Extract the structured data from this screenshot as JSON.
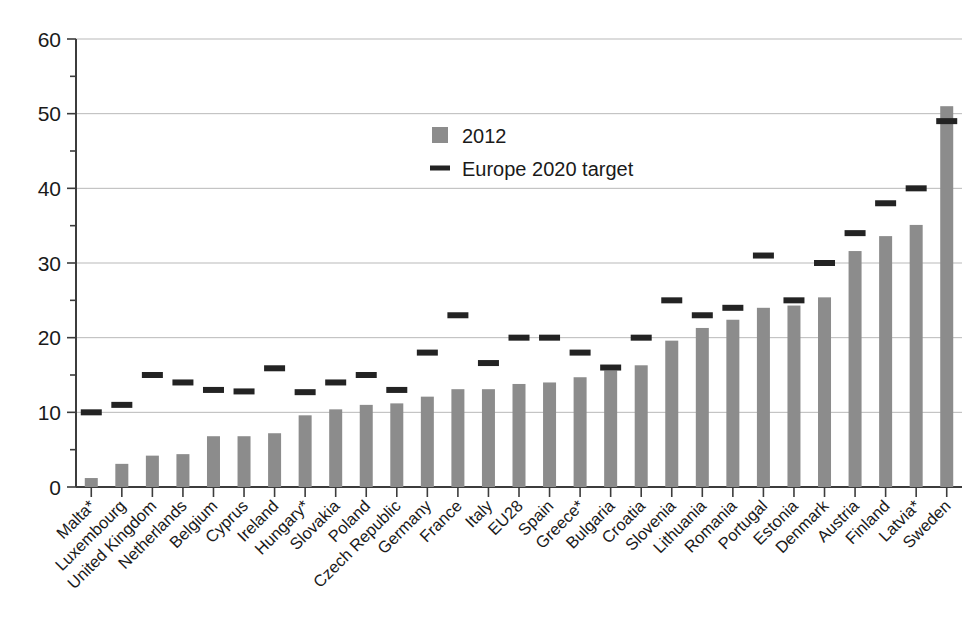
{
  "chart_data": {
    "type": "bar",
    "title": "",
    "subtitle": "",
    "xlabel": "",
    "ylabel": "",
    "ylim": [
      0,
      60
    ],
    "yticks": [
      0,
      10,
      20,
      30,
      40,
      50,
      60
    ],
    "grid": true,
    "legend_position": "upper-center",
    "categories": [
      "Malta*",
      "Luxembourg",
      "United Kingdom",
      "Netherlands",
      "Belgium",
      "Cyprus",
      "Ireland",
      "Hungary*",
      "Slovakia",
      "Poland",
      "Czech Republic",
      "Germany",
      "France",
      "Italy",
      "EU28",
      "Spain",
      "Greece*",
      "Bulgaria",
      "Croatia",
      "Slovenia",
      "Lithuania",
      "Romania",
      "Portugal",
      "Estonia",
      "Denmark",
      "Austria",
      "Finland",
      "Latvia*",
      "Sweden"
    ],
    "series": [
      {
        "name": "2012",
        "type": "bar",
        "color": "#8c8c8c",
        "values": [
          1.2,
          3.1,
          4.2,
          4.4,
          6.8,
          6.8,
          7.2,
          9.6,
          10.4,
          11.0,
          11.2,
          12.1,
          13.1,
          13.1,
          13.8,
          14.0,
          14.7,
          15.6,
          16.3,
          19.6,
          21.3,
          22.4,
          24.0,
          24.3,
          25.4,
          31.6,
          33.6,
          35.1,
          51.0
        ]
      },
      {
        "name": "Europe 2020 target",
        "type": "marker-dash",
        "color": "#232323",
        "values": [
          10.0,
          11.0,
          15.0,
          14.0,
          13.0,
          12.8,
          15.9,
          12.7,
          14.0,
          15.0,
          13.0,
          18.0,
          23.0,
          16.6,
          20.0,
          20.0,
          18.0,
          16.0,
          20.0,
          25.0,
          23.0,
          24.0,
          31.0,
          25.0,
          30.0,
          34.0,
          38.0,
          40.0,
          49.0
        ]
      }
    ],
    "legend": [
      {
        "label": "2012",
        "marker": "square",
        "color": "#8c8c8c"
      },
      {
        "label": "Europe 2020 target",
        "marker": "dash",
        "color": "#232323"
      }
    ]
  },
  "axis": {
    "y_tick_labels": [
      "0",
      "10",
      "20",
      "30",
      "40",
      "50",
      "60"
    ]
  }
}
